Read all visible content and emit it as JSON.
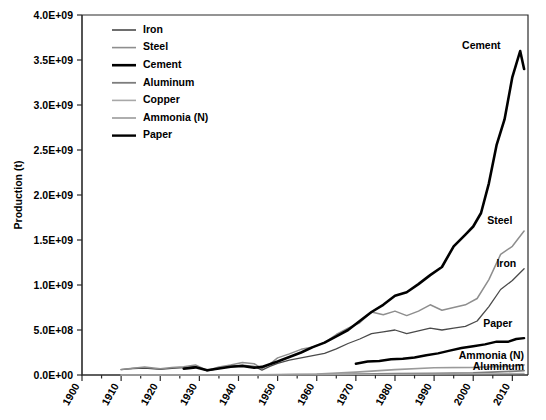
{
  "chart_data": {
    "type": "line",
    "title": "",
    "xlabel": "",
    "ylabel": "Production (t)",
    "xlim": [
      1900,
      2014
    ],
    "ylim": [
      0,
      4000000000
    ],
    "grid": false,
    "legend_position": "top-left inside plot",
    "xticks": [
      "1900",
      "1910",
      "1920",
      "1930",
      "1940",
      "1950",
      "1960",
      "1970",
      "1980",
      "1990",
      "2000",
      "2010"
    ],
    "xtick_values": [
      1900,
      1910,
      1920,
      1930,
      1940,
      1950,
      1960,
      1970,
      1980,
      1990,
      2000,
      2010
    ],
    "yticks": [
      "0.0E+00",
      "5.0E+08",
      "1.0E+09",
      "1.5E+09",
      "2.0E+09",
      "2.5E+09",
      "3.0E+09",
      "3.5E+09",
      "4.0E+09"
    ],
    "ytick_values": [
      0,
      500000000,
      1000000000,
      1500000000,
      2000000000,
      2500000000,
      3000000000,
      3500000000,
      4000000000
    ],
    "series": [
      {
        "name": "Iron",
        "color": "#4a4a4a",
        "width": 1.3,
        "x": [
          1910,
          1913,
          1916,
          1920,
          1923,
          1926,
          1929,
          1932,
          1935,
          1938,
          1941,
          1944,
          1946,
          1948,
          1950,
          1953,
          1956,
          1959,
          1962,
          1965,
          1968,
          1971,
          1974,
          1977,
          1980,
          1983,
          1986,
          1989,
          1992,
          1995,
          1998,
          2001,
          2004,
          2007,
          2010,
          2013
        ],
        "values": [
          60000000,
          72000000,
          78000000,
          62000000,
          75000000,
          83000000,
          95000000,
          45000000,
          75000000,
          98000000,
          110000000,
          95000000,
          55000000,
          95000000,
          130000000,
          165000000,
          190000000,
          215000000,
          240000000,
          290000000,
          350000000,
          400000000,
          460000000,
          480000000,
          500000000,
          460000000,
          490000000,
          520000000,
          500000000,
          520000000,
          540000000,
          600000000,
          760000000,
          950000000,
          1050000000,
          1180000000
        ]
      },
      {
        "name": "Steel",
        "color": "#8e8e8e",
        "width": 1.5,
        "x": [
          1910,
          1913,
          1916,
          1920,
          1923,
          1926,
          1929,
          1932,
          1935,
          1938,
          1941,
          1944,
          1946,
          1948,
          1950,
          1953,
          1956,
          1959,
          1962,
          1965,
          1968,
          1971,
          1974,
          1977,
          1980,
          1983,
          1986,
          1989,
          1992,
          1995,
          1998,
          2001,
          2004,
          2007,
          2010,
          2013
        ],
        "values": [
          62000000,
          76000000,
          88000000,
          70000000,
          82000000,
          92000000,
          112000000,
          50000000,
          90000000,
          110000000,
          140000000,
          125000000,
          70000000,
          120000000,
          190000000,
          235000000,
          285000000,
          310000000,
          360000000,
          450000000,
          520000000,
          580000000,
          700000000,
          670000000,
          710000000,
          660000000,
          710000000,
          780000000,
          720000000,
          750000000,
          780000000,
          850000000,
          1060000000,
          1340000000,
          1430000000,
          1600000000
        ]
      },
      {
        "name": "Cement",
        "color": "#000000",
        "width": 2.6,
        "x": [
          1926,
          1929,
          1932,
          1935,
          1938,
          1941,
          1944,
          1946,
          1948,
          1950,
          1953,
          1956,
          1959,
          1962,
          1965,
          1968,
          1971,
          1974,
          1977,
          1980,
          1983,
          1986,
          1989,
          1992,
          1995,
          1998,
          2000,
          2002,
          2004,
          2006,
          2008,
          2010,
          2012,
          2013
        ],
        "values": [
          70000000,
          85000000,
          52000000,
          72000000,
          92000000,
          100000000,
          80000000,
          90000000,
          120000000,
          150000000,
          200000000,
          250000000,
          310000000,
          360000000,
          430000000,
          500000000,
          600000000,
          700000000,
          780000000,
          880000000,
          920000000,
          1010000000,
          1110000000,
          1200000000,
          1430000000,
          1560000000,
          1650000000,
          1800000000,
          2130000000,
          2560000000,
          2840000000,
          3310000000,
          3600000000,
          3400000000
        ]
      },
      {
        "name": "Aluminum",
        "color": "#7d7d7d",
        "width": 1.8,
        "x": [
          1910,
          1920,
          1930,
          1940,
          1950,
          1960,
          1970,
          1980,
          1990,
          2000,
          2010,
          2013
        ],
        "values": [
          40000,
          130000,
          270000,
          800000,
          1500000,
          4500000,
          10000000,
          16000000,
          19000000,
          24000000,
          41000000,
          49000000
        ]
      },
      {
        "name": "Copper",
        "color": "#a8a8a8",
        "width": 1.2,
        "x": [
          1910,
          1920,
          1930,
          1940,
          1950,
          1960,
          1970,
          1980,
          1990,
          2000,
          2010,
          2013
        ],
        "values": [
          900000,
          950000,
          1600000,
          2400000,
          2600000,
          4200000,
          6400000,
          7800000,
          9000000,
          13200000,
          16000000,
          18000000
        ]
      },
      {
        "name": "Ammonia (N)",
        "color": "#9a9a9a",
        "width": 1.6,
        "x": [
          1910,
          1920,
          1930,
          1940,
          1950,
          1960,
          1970,
          1980,
          1990,
          2000,
          2010,
          2013
        ],
        "values": [
          300000,
          500000,
          1200000,
          2500000,
          4000000,
          11000000,
          32000000,
          60000000,
          80000000,
          85000000,
          100000000,
          112000000
        ]
      },
      {
        "name": "Paper",
        "color": "#000000",
        "width": 2.4,
        "x": [
          1970,
          1973,
          1976,
          1979,
          1982,
          1985,
          1988,
          1991,
          1994,
          1997,
          2000,
          2003,
          2006,
          2009,
          2011,
          2013
        ],
        "values": [
          125000000,
          150000000,
          155000000,
          175000000,
          180000000,
          195000000,
          220000000,
          240000000,
          270000000,
          300000000,
          320000000,
          340000000,
          370000000,
          370000000,
          400000000,
          410000000
        ]
      }
    ],
    "inline_labels": [
      {
        "text": "Cement",
        "x": 2007,
        "y": 3620000000,
        "anchor": "end"
      },
      {
        "text": "Steel",
        "x": 2010,
        "y": 1680000000,
        "anchor": "end"
      },
      {
        "text": "Iron",
        "x": 2011,
        "y": 1200000000,
        "anchor": "end"
      },
      {
        "text": "Paper",
        "x": 2010,
        "y": 530000000,
        "anchor": "end"
      },
      {
        "text": "Ammonia (N)",
        "x": 2013,
        "y": 175000000,
        "anchor": "end"
      },
      {
        "text": "Aluminum",
        "x": 2013,
        "y": 60000000,
        "anchor": "end"
      }
    ]
  },
  "legend": {
    "items": [
      {
        "label": "Iron"
      },
      {
        "label": "Steel"
      },
      {
        "label": "Cement"
      },
      {
        "label": "Aluminum"
      },
      {
        "label": "Copper"
      },
      {
        "label": "Ammonia (N)"
      },
      {
        "label": "Paper"
      }
    ]
  }
}
